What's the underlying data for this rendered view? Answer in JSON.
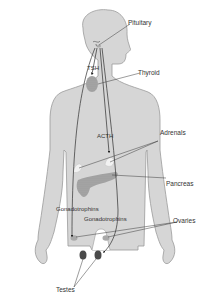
{
  "diagram": {
    "type": "endocrine-system-figure",
    "colors": {
      "body_fill": "#d6d6d6",
      "body_outline": "#9a9a9a",
      "line": "#3a3a3a",
      "gland_fill": "#a9a9a9",
      "adrenal_fill": "#f2f2f2",
      "testes_fill": "#4a4a4a",
      "label_text": "#333333"
    },
    "organs": {
      "pituitary": "Pituitary",
      "thyroid": "Thyroid",
      "adrenals": "Adrenals",
      "pancreas": "Pancreas",
      "ovaries": "Ovaries",
      "testes": "Testes"
    },
    "hormones": {
      "tsh": "TSH",
      "acth": "ACTH",
      "gonadotrophins_left": "Gonadotrophins",
      "gonadotrophins_right": "Gonadotrophins"
    }
  }
}
